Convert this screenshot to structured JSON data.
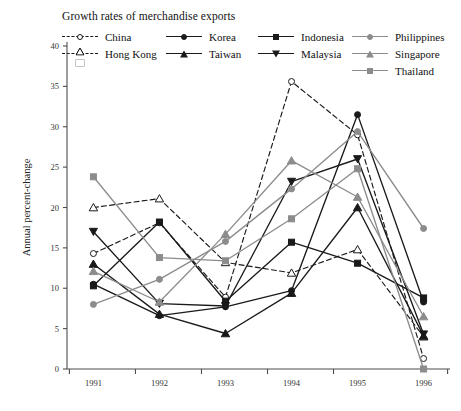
{
  "chart_data": {
    "type": "line",
    "title": "Growth rates of merchandise exports",
    "xlabel": "",
    "ylabel": "Annual percent-change",
    "categories": [
      "1991",
      "1992",
      "1993",
      "1994",
      "1995",
      "1996"
    ],
    "x": [
      1991,
      1992,
      1993,
      1994,
      1995,
      1996
    ],
    "xlim": [
      1990.6,
      1996.4
    ],
    "ylim": [
      0,
      40
    ],
    "yticks": [
      0,
      5,
      10,
      15,
      20,
      25,
      30,
      35,
      40
    ],
    "grid": false,
    "legend_position": "top",
    "series": [
      {
        "name": "China",
        "values": [
          14.3,
          18.1,
          8.9,
          35.6,
          29.0,
          1.3
        ],
        "color": "#1a1a1a",
        "marker": "circle-open",
        "linestyle": "dashed"
      },
      {
        "name": "Hong Kong",
        "values": [
          20.0,
          21.1,
          13.2,
          11.9,
          14.8,
          4.0
        ],
        "color": "#1a1a1a",
        "marker": "triangle-open",
        "linestyle": "dashed"
      },
      {
        "name": "Korea",
        "values": [
          10.5,
          6.6,
          7.7,
          9.7,
          31.5,
          8.3
        ],
        "color": "#1a1a1a",
        "marker": "circle-filled",
        "linestyle": "solid"
      },
      {
        "name": "Taiwan",
        "values": [
          13.0,
          6.8,
          4.4,
          9.4,
          20.0,
          4.1
        ],
        "color": "#1a1a1a",
        "marker": "triangle-filled",
        "linestyle": "solid"
      },
      {
        "name": "Indonesia",
        "values": [
          10.3,
          18.2,
          8.4,
          15.7,
          13.1,
          8.8
        ],
        "color": "#1a1a1a",
        "marker": "square-filled",
        "linestyle": "solid"
      },
      {
        "name": "Malaysia",
        "values": [
          17.0,
          8.1,
          7.8,
          23.2,
          26.0,
          4.3
        ],
        "color": "#1a1a1a",
        "marker": "dtriangle-filled",
        "linestyle": "solid"
      },
      {
        "name": "Philippines",
        "values": [
          8.0,
          11.1,
          15.8,
          22.3,
          29.4,
          17.4
        ],
        "color": "#8c8c8c",
        "marker": "circle-filled",
        "linestyle": "solid"
      },
      {
        "name": "Singapore",
        "values": [
          12.1,
          8.3,
          16.7,
          25.8,
          21.3,
          6.5
        ],
        "color": "#8c8c8c",
        "marker": "triangle-filled",
        "linestyle": "solid"
      },
      {
        "name": "Thailand",
        "values": [
          23.8,
          13.8,
          13.4,
          18.6,
          24.8,
          0.0
        ],
        "color": "#8c8c8c",
        "marker": "square-filled",
        "linestyle": "solid"
      }
    ]
  },
  "legend": {
    "columns": [
      {
        "items": [
          {
            "label": "China",
            "series": 0
          },
          {
            "label": "Hong Kong",
            "series": 1
          }
        ]
      },
      {
        "items": [
          {
            "label": "Korea",
            "series": 2
          },
          {
            "label": "Taiwan",
            "series": 3
          }
        ]
      },
      {
        "items": [
          {
            "label": "Indonesia",
            "series": 4
          },
          {
            "label": "Malaysia",
            "series": 5
          }
        ]
      },
      {
        "items": [
          {
            "label": "Philippines",
            "series": 6
          },
          {
            "label": "Singapore",
            "series": 7
          },
          {
            "label": "Thailand",
            "series": 8
          }
        ]
      }
    ]
  }
}
